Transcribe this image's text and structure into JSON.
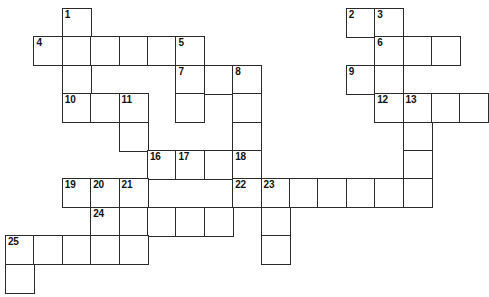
{
  "puzzle": {
    "title": "Crossword Grid",
    "type": "crossword",
    "geometry": {
      "origin_x": 5,
      "origin_y": 8,
      "cell_size": 28.4,
      "columns": 15,
      "rows": 10,
      "border_color": "#2b2b2b",
      "cell_fill": "#ffffff",
      "page_background": "#ffffff",
      "number_color": "#111111"
    },
    "cells": [
      {
        "r": 0,
        "c": 2,
        "n": "1"
      },
      {
        "r": 0,
        "c": 12,
        "n": "2"
      },
      {
        "r": 0,
        "c": 13,
        "n": "3"
      },
      {
        "r": 1,
        "c": 1,
        "n": "4"
      },
      {
        "r": 1,
        "c": 2,
        "n": ""
      },
      {
        "r": 1,
        "c": 3,
        "n": ""
      },
      {
        "r": 1,
        "c": 4,
        "n": ""
      },
      {
        "r": 1,
        "c": 5,
        "n": ""
      },
      {
        "r": 1,
        "c": 6,
        "n": "5"
      },
      {
        "r": 1,
        "c": 13,
        "n": "6"
      },
      {
        "r": 1,
        "c": 14,
        "n": ""
      },
      {
        "r": 1,
        "c": 15,
        "n": ""
      },
      {
        "r": 2,
        "c": 2,
        "n": ""
      },
      {
        "r": 2,
        "c": 6,
        "n": "7"
      },
      {
        "r": 2,
        "c": 7,
        "n": ""
      },
      {
        "r": 2,
        "c": 8,
        "n": "8"
      },
      {
        "r": 2,
        "c": 12,
        "n": "9"
      },
      {
        "r": 2,
        "c": 13,
        "n": ""
      },
      {
        "r": 3,
        "c": 2,
        "n": "10"
      },
      {
        "r": 3,
        "c": 3,
        "n": ""
      },
      {
        "r": 3,
        "c": 4,
        "n": "11"
      },
      {
        "r": 3,
        "c": 6,
        "n": ""
      },
      {
        "r": 3,
        "c": 8,
        "n": ""
      },
      {
        "r": 3,
        "c": 13,
        "n": "12"
      },
      {
        "r": 3,
        "c": 14,
        "n": "13"
      },
      {
        "r": 3,
        "c": 15,
        "n": ""
      },
      {
        "r": 3,
        "c": 16,
        "n": ""
      },
      {
        "r": 4,
        "c": 4,
        "n": ""
      },
      {
        "r": 4,
        "c": 8,
        "n": ""
      },
      {
        "r": 4,
        "c": 14,
        "n": ""
      },
      {
        "r": 5,
        "c": 5,
        "n": "16"
      },
      {
        "r": 5,
        "c": 6,
        "n": "17"
      },
      {
        "r": 5,
        "c": 7,
        "n": ""
      },
      {
        "r": 5,
        "c": 8,
        "n": "18"
      },
      {
        "r": 5,
        "c": 14,
        "n": ""
      },
      {
        "r": 6,
        "c": 2,
        "n": "19"
      },
      {
        "r": 6,
        "c": 3,
        "n": "20"
      },
      {
        "r": 6,
        "c": 4,
        "n": "21"
      },
      {
        "r": 6,
        "c": 8,
        "n": "22"
      },
      {
        "r": 6,
        "c": 9,
        "n": "23"
      },
      {
        "r": 6,
        "c": 10,
        "n": ""
      },
      {
        "r": 6,
        "c": 11,
        "n": ""
      },
      {
        "r": 6,
        "c": 12,
        "n": ""
      },
      {
        "r": 6,
        "c": 13,
        "n": ""
      },
      {
        "r": 6,
        "c": 14,
        "n": ""
      },
      {
        "r": 7,
        "c": 3,
        "n": "24"
      },
      {
        "r": 7,
        "c": 4,
        "n": ""
      },
      {
        "r": 7,
        "c": 5,
        "n": ""
      },
      {
        "r": 7,
        "c": 6,
        "n": ""
      },
      {
        "r": 7,
        "c": 7,
        "n": ""
      },
      {
        "r": 7,
        "c": 9,
        "n": ""
      },
      {
        "r": 8,
        "c": 0,
        "n": "25"
      },
      {
        "r": 8,
        "c": 1,
        "n": ""
      },
      {
        "r": 8,
        "c": 2,
        "n": ""
      },
      {
        "r": 8,
        "c": 3,
        "n": ""
      },
      {
        "r": 8,
        "c": 4,
        "n": ""
      },
      {
        "r": 8,
        "c": 9,
        "n": ""
      },
      {
        "r": 9,
        "c": 0,
        "n": ""
      }
    ]
  }
}
